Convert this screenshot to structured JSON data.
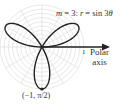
{
  "diagram": {
    "equation_m": "m",
    "equation_eq": " = 3: ",
    "equation_r": "r",
    "equation_rhs": " = sin 3",
    "equation_theta": "θ",
    "tick_label": "1",
    "axis_label_line1": "Polar",
    "axis_label_line2": "axis",
    "point_label": "(−1, π/2)",
    "curve": "r = sin 3θ",
    "petals": 3,
    "colors": {
      "curve": "#222222",
      "grid": "#d8d8d8",
      "axis": "#222222"
    }
  }
}
